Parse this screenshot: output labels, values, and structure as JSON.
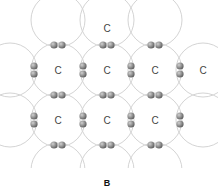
{
  "figure": {
    "caption": "B",
    "atom_label": "C",
    "colors": {
      "background": "#ffffff",
      "orbital_stroke": "#d4d4d4",
      "electron_light": "#b8b8b8",
      "electron_dark": "#6a6a6a",
      "label": "#444444",
      "caption": "#111111"
    },
    "atoms": [
      {
        "label": "C",
        "x": 107,
        "y": 28
      },
      {
        "label": "C",
        "x": 58,
        "y": 70
      },
      {
        "label": "C",
        "x": 107,
        "y": 70
      },
      {
        "label": "C",
        "x": 155,
        "y": 70
      },
      {
        "label": "C",
        "x": 203,
        "y": 70
      },
      {
        "label": "C",
        "x": 58,
        "y": 120
      },
      {
        "label": "C",
        "x": 107,
        "y": 120
      },
      {
        "label": "C",
        "x": 155,
        "y": 120
      }
    ],
    "electron_pairs": {
      "horizontal": [
        {
          "x": 58,
          "y": 45
        },
        {
          "x": 107,
          "y": 45
        },
        {
          "x": 155,
          "y": 45
        },
        {
          "x": 58,
          "y": 95
        },
        {
          "x": 107,
          "y": 95
        },
        {
          "x": 155,
          "y": 95
        },
        {
          "x": 58,
          "y": 145
        },
        {
          "x": 107,
          "y": 145
        },
        {
          "x": 155,
          "y": 145
        }
      ],
      "vertical": [
        {
          "x": 34,
          "y": 70
        },
        {
          "x": 83,
          "y": 70
        },
        {
          "x": 131,
          "y": 70
        },
        {
          "x": 180,
          "y": 70
        },
        {
          "x": 34,
          "y": 120
        },
        {
          "x": 83,
          "y": 120
        },
        {
          "x": 131,
          "y": 120
        },
        {
          "x": 180,
          "y": 120
        }
      ]
    },
    "orbital_circles": [
      {
        "x": 58,
        "y": 20
      },
      {
        "x": 107,
        "y": 20
      },
      {
        "x": 155,
        "y": 20
      },
      {
        "x": 10,
        "y": 70
      },
      {
        "x": 58,
        "y": 70
      },
      {
        "x": 107,
        "y": 70
      },
      {
        "x": 155,
        "y": 70
      },
      {
        "x": 203,
        "y": 70
      },
      {
        "x": 10,
        "y": 120
      },
      {
        "x": 58,
        "y": 120
      },
      {
        "x": 107,
        "y": 120
      },
      {
        "x": 155,
        "y": 120
      },
      {
        "x": 203,
        "y": 120
      },
      {
        "x": 58,
        "y": 170
      },
      {
        "x": 107,
        "y": 170
      },
      {
        "x": 155,
        "y": 170
      }
    ],
    "orbital_radius": 27
  }
}
